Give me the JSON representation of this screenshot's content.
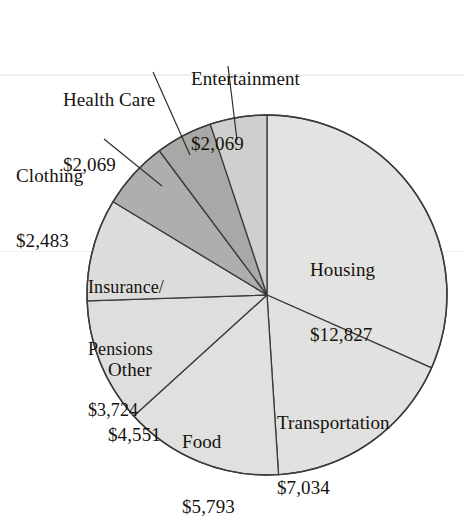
{
  "chart_data": {
    "type": "pie",
    "title": "",
    "subtitle": "",
    "xlabel": "",
    "ylabel": "",
    "legend_position": "none",
    "grid": false,
    "value_prefix": "$",
    "total": 40550,
    "start_angle_deg": 0,
    "direction": "clockwise",
    "categories": [
      "Housing",
      "Transportation",
      "Food",
      "Other",
      "Insurance/Pensions",
      "Clothing",
      "Health Care",
      "Entertainment"
    ],
    "values": [
      12827,
      7034,
      5793,
      4551,
      3724,
      2483,
      2069,
      2069
    ],
    "slices": [
      {
        "name": "Housing",
        "label_line1": "Housing",
        "label_line2": "$12,827",
        "value": 12827,
        "angle_deg": 113.9,
        "color": "#e3e3e1",
        "label_placement": "inside"
      },
      {
        "name": "Transportation",
        "label_line1": "Transportation",
        "label_line2": "$7,034",
        "value": 7034,
        "angle_deg": 62.5,
        "color": "#e1e1df",
        "label_placement": "inside"
      },
      {
        "name": "Food",
        "label_line1": "Food",
        "label_line2": "$5,793",
        "value": 5793,
        "angle_deg": 51.4,
        "color": "#e0e0de",
        "label_placement": "inside"
      },
      {
        "name": "Other",
        "label_line1": "Other",
        "label_line2": "$4,551",
        "value": 4551,
        "angle_deg": 40.4,
        "color": "#dededc",
        "label_placement": "inside"
      },
      {
        "name": "Insurance/Pensions",
        "label_line1": "Insurance/",
        "label_line2": "Pensions",
        "label_line3": "$3,724",
        "value": 3724,
        "angle_deg": 33.1,
        "color": "#dcdcda",
        "label_placement": "inside"
      },
      {
        "name": "Clothing",
        "label_line1": "Clothing",
        "label_line2": "$2,483",
        "value": 2483,
        "angle_deg": 22.0,
        "color": "#aeaeac",
        "label_placement": "outside-leader"
      },
      {
        "name": "Health Care",
        "label_line1": "Health Care",
        "label_line2": "$2,069",
        "value": 2069,
        "angle_deg": 18.4,
        "color": "#a8a8a6",
        "label_placement": "outside-leader"
      },
      {
        "name": "Entertainment",
        "label_line1": "Entertainment",
        "label_line2": "$2,069",
        "value": 2069,
        "angle_deg": 18.4,
        "color": "#cfcfcd",
        "label_placement": "outside-leader"
      }
    ],
    "colors": {
      "outline": "#3b3b3b",
      "leader_line": "#2e2e2e",
      "text": "#15120f",
      "background": "#ffffff"
    }
  }
}
